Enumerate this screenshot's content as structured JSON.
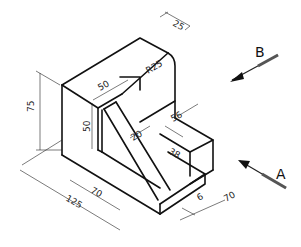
{
  "drawing": {
    "type": "isometric technical drawing",
    "view_labels": {
      "A": "A",
      "B": "B"
    },
    "dimensions": {
      "height_total": "75",
      "upright_height": "50",
      "top_width": "50",
      "top_depth": "25",
      "radius": "R25",
      "step_depth": "56",
      "rib_thickness": "20",
      "step_width": "38",
      "base_inner": "70",
      "base_total": "125",
      "base_thickness": "6",
      "base_depth": "70"
    }
  }
}
